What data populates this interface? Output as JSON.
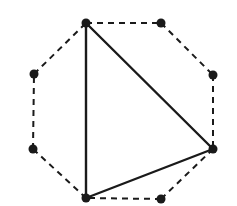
{
  "diagram": {
    "type": "octagon-with-inscribed-triangle",
    "colors": {
      "background": "#ffffff",
      "stroke": "#1a1a1a",
      "vertex": "#1a1a1a"
    },
    "octagon": {
      "style": "dashed",
      "vertices": [
        {
          "x": 86,
          "y": 23
        },
        {
          "x": 161,
          "y": 23
        },
        {
          "x": 213,
          "y": 75
        },
        {
          "x": 213,
          "y": 149
        },
        {
          "x": 161,
          "y": 199
        },
        {
          "x": 86,
          "y": 198
        },
        {
          "x": 33,
          "y": 149
        },
        {
          "x": 34,
          "y": 74
        }
      ]
    },
    "triangle": {
      "style": "solid",
      "vertex_indices": [
        0,
        3,
        5
      ]
    },
    "vertex_radius": 4.5
  }
}
